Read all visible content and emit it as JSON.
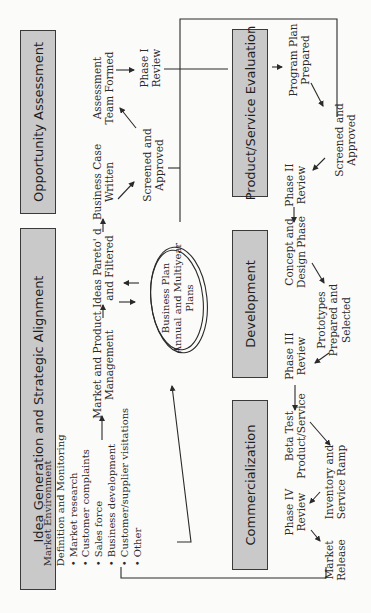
{
  "diagram": {
    "orientation": "rotated-90-ccw",
    "colors": {
      "box_fill": "#c9c9c9",
      "box_border": "#3a3a3a",
      "line": "#2a2a2a",
      "background": "#fbfbfa"
    },
    "phases": [
      {
        "id": "opportunity",
        "label": "Opportunity Assessment"
      },
      {
        "id": "idea",
        "label": "Idea Generation and Strategic Alignment"
      },
      {
        "id": "evaluation",
        "label": "Product/Service Evaluation"
      },
      {
        "id": "development",
        "label": "Development"
      },
      {
        "id": "commercialization",
        "label": "Commercialization"
      }
    ],
    "market_env": {
      "line1": "Market Environment",
      "line2": "Definition and Monitoring",
      "bullets": [
        "Market research",
        "Customer complaints",
        "Sales force",
        "Business development",
        "Customer/supplier visitations",
        "Other"
      ]
    },
    "steps": {
      "mpm": {
        "l1": "Market and Product",
        "l2": "Management"
      },
      "ideas": {
        "l1": "Ideas Pareto' d",
        "l2": "and Filtered"
      },
      "bizcase": {
        "l1": "Business Case",
        "l2": "Written"
      },
      "screened1": {
        "l1": "Screened and",
        "l2": "Approved"
      },
      "team": {
        "l1": "Assessment",
        "l2": "Team Formed"
      },
      "phase1": {
        "l1": "Phase I",
        "l2": "Review"
      },
      "programplan": {
        "l1": "Program Plan",
        "l2": "Prepared"
      },
      "screened2": {
        "l1": "Screened and",
        "l2": "Approved"
      },
      "phase2": {
        "l1": "Phase II",
        "l2": "Review"
      },
      "concept": {
        "l1": "Concept and",
        "l2": "Design Phase"
      },
      "prototypes": {
        "l1": "Prototypes",
        "l2": "Prepared and",
        "l3": "Selected"
      },
      "phase3": {
        "l1": "Phase III",
        "l2": "Review"
      },
      "beta": {
        "l1": "Beta Test",
        "l2": "Product/Service"
      },
      "inventory": {
        "l1": "Inventory and",
        "l2": "Service Ramp"
      },
      "phase4": {
        "l1": "Phase IV",
        "l2": "Review"
      },
      "release": {
        "l1": "Market",
        "l2": "Release"
      }
    },
    "business_plan": {
      "l1": "Business Plan",
      "l2": "Annual and Multiyear",
      "l3": "Plans"
    }
  }
}
